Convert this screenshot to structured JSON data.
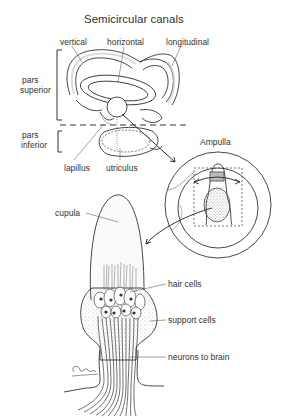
{
  "title": "Semicircular canals",
  "labels": {
    "vertical": "vertical",
    "horizontal": "horizontal",
    "longitudinal": "longitudinal",
    "pars_superior": "pars\nsuperior",
    "pars_superior_l1": "pars",
    "pars_superior_l2": "superior",
    "pars_inferior_l1": "pars",
    "pars_inferior_l2": "inferior",
    "lapillus": "lapillus",
    "utriculus": "utriculus",
    "ampulla": "Ampulla",
    "cupula": "cupula",
    "hair_cells": "hair cells",
    "support_cells": "support cells",
    "neurons_to_brain": "neurons to brain"
  },
  "colors": {
    "line": "#333333",
    "stipple": "#bbbbbb",
    "background": "#ffffff"
  }
}
